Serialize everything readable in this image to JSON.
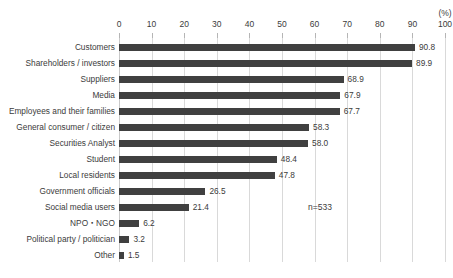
{
  "chart_data": {
    "type": "bar",
    "orientation": "horizontal",
    "title": "",
    "xlabel": "(%)",
    "ylabel": "",
    "xlim": [
      0,
      100
    ],
    "xticks": [
      0,
      10,
      20,
      30,
      40,
      50,
      60,
      70,
      80,
      90,
      100
    ],
    "grid": true,
    "legend": false,
    "bar_color": "#404040",
    "categories": [
      "Customers",
      "Shareholders / investors",
      "Suppliers",
      "Media",
      "Employees and their families",
      "General consumer / citizen",
      "Securities Analyst",
      "Student",
      "Local residents",
      "Government officials",
      "Social media users",
      "NPO・NGO",
      "Political party / politician",
      "Other"
    ],
    "values": [
      90.8,
      89.9,
      68.9,
      67.9,
      67.7,
      58.3,
      58.0,
      48.4,
      47.8,
      26.5,
      21.4,
      6.2,
      3.2,
      1.5
    ],
    "value_labels": [
      "90.8",
      "89.9",
      "68.9",
      "67.9",
      "67.7",
      "58.3",
      "58.0",
      "48.4",
      "47.8",
      "26.5",
      "21.4",
      "6.2",
      "3.2",
      "1.5"
    ],
    "annotations": [
      {
        "text": "n=533",
        "x": 58,
        "row": 10
      }
    ]
  }
}
